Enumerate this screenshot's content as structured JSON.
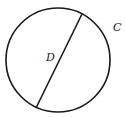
{
  "diagram": {
    "shape": "circle",
    "labels": {
      "diameter": "D",
      "circumference": "C"
    },
    "colors": {
      "stroke": "#1a1a1a",
      "background": "#ffffff",
      "text": "#222222"
    }
  }
}
